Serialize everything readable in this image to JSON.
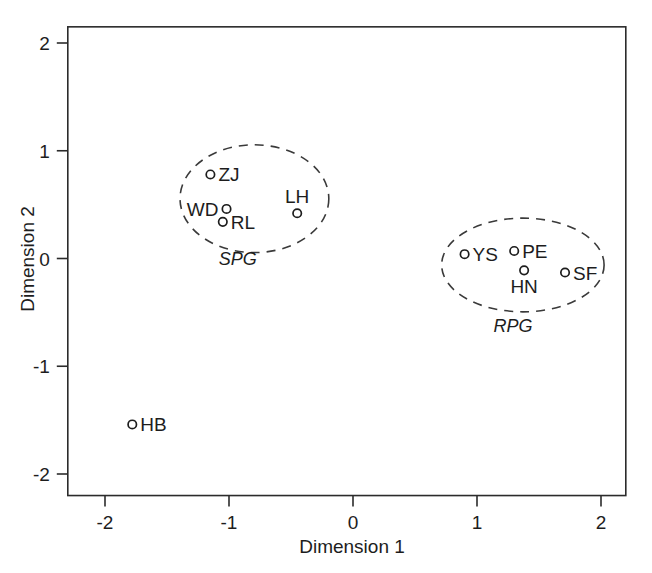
{
  "chart_data": {
    "type": "scatter",
    "title": "",
    "xlabel": "Dimension 1",
    "ylabel": "Dimension 2",
    "xlim": [
      -2.3,
      2.2
    ],
    "ylim": [
      -2.2,
      2.15
    ],
    "grid": false,
    "legend": "none",
    "xticks": [
      -2,
      -1,
      0,
      1,
      2
    ],
    "yticks": [
      -2,
      -1,
      0,
      1,
      2
    ],
    "xtick_labels": [
      "-2",
      "-1",
      "0",
      "1",
      "2"
    ],
    "ytick_labels": [
      "-2",
      "-1",
      "0",
      "1",
      "2"
    ],
    "marker_style": "open-circle",
    "points": [
      {
        "label": "ZJ",
        "x": -1.15,
        "y": 0.78,
        "label_side": "right"
      },
      {
        "label": "WD",
        "x": -1.02,
        "y": 0.46,
        "label_side": "left"
      },
      {
        "label": "RL",
        "x": -1.05,
        "y": 0.34,
        "label_side": "right"
      },
      {
        "label": "LH",
        "x": -0.45,
        "y": 0.42,
        "label_side": "above"
      },
      {
        "label": "YS",
        "x": 0.9,
        "y": 0.04,
        "label_side": "right"
      },
      {
        "label": "PE",
        "x": 1.3,
        "y": 0.07,
        "label_side": "right"
      },
      {
        "label": "HN",
        "x": 1.38,
        "y": -0.11,
        "label_side": "below"
      },
      {
        "label": "SF",
        "x": 1.71,
        "y": -0.13,
        "label_side": "right"
      },
      {
        "label": "HB",
        "x": -1.78,
        "y": -1.54,
        "label_side": "right"
      }
    ],
    "clusters": [
      {
        "label": "SPG",
        "members": [
          "ZJ",
          "WD",
          "RL",
          "LH"
        ],
        "center_x": -0.795,
        "center_y": 0.555,
        "radius_x": 0.6,
        "radius_y": 0.5,
        "label_x": -0.93,
        "label_y": -0.06
      },
      {
        "label": "RPG",
        "members": [
          "YS",
          "PE",
          "HN",
          "SF"
        ],
        "center_x": 1.37,
        "center_y": -0.06,
        "radius_x": 0.655,
        "radius_y": 0.435,
        "label_x": 1.29,
        "label_y": -0.68
      }
    ]
  }
}
